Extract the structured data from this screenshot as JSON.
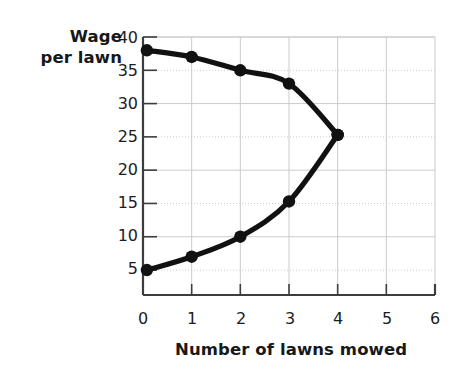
{
  "chart_data": {
    "type": "line",
    "title": "",
    "subtitle": "",
    "xlabel": "Number of lawns mowed",
    "ylabel": "Wage per lawn",
    "ylabel_lines": [
      "Wage",
      "per lawn"
    ],
    "xlim": [
      0,
      6
    ],
    "ylim": [
      0,
      40
    ],
    "xticks": [
      0,
      1,
      2,
      3,
      4,
      5,
      6
    ],
    "xtick_labels": [
      "0",
      "1",
      "2",
      "3",
      "4",
      "5",
      "6"
    ],
    "yticks": [
      5,
      10,
      15,
      20,
      25,
      30,
      35,
      40
    ],
    "ytick_labels": [
      "5",
      "10",
      "15",
      "20",
      "25",
      "30",
      "35",
      "40"
    ],
    "grid": true,
    "grid_color": "#c9cbcd",
    "legend": false,
    "legend_position": "none",
    "line_color": "#111111",
    "marker": "circle",
    "marker_color": "#111111",
    "series": [
      {
        "name": "upper-branch",
        "points": [
          {
            "x": 0.08,
            "y": 38.0
          },
          {
            "x": 1.0,
            "y": 37.0
          },
          {
            "x": 2.0,
            "y": 35.0
          },
          {
            "x": 3.0,
            "y": 33.0
          },
          {
            "x": 4.0,
            "y": 25.3
          }
        ]
      },
      {
        "name": "lower-branch",
        "points": [
          {
            "x": 0.08,
            "y": 5.0
          },
          {
            "x": 1.0,
            "y": 7.0
          },
          {
            "x": 2.0,
            "y": 10.0
          },
          {
            "x": 3.0,
            "y": 15.3
          },
          {
            "x": 4.0,
            "y": 25.3
          }
        ]
      }
    ],
    "annotations": []
  },
  "axes": {
    "axis_color": "#3b3d3f",
    "tick_color": "#3b3d3f",
    "background": "#ffffff"
  }
}
